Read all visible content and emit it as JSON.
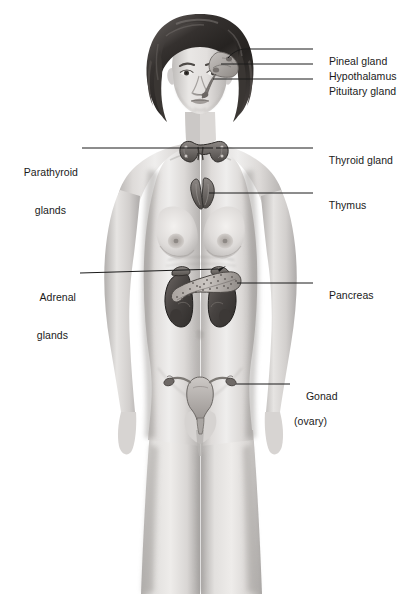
{
  "figure": {
    "style": "grayscale pencil/airbrush medical illustration",
    "background_color": "#ffffff",
    "line_color": "#1a1a1a",
    "text_color": "#1a1a1a"
  },
  "labels": {
    "pineal": {
      "line1": "Pineal gland",
      "line2": ""
    },
    "hypothalamus": {
      "line1": "Hypothalamus",
      "line2": ""
    },
    "pituitary": {
      "line1": "Pituitary gland",
      "line2": ""
    },
    "thyroid": {
      "line1": "Thyroid gland",
      "line2": ""
    },
    "thymus": {
      "line1": "Thymus",
      "line2": ""
    },
    "pancreas": {
      "line1": "Pancreas",
      "line2": ""
    },
    "gonad": {
      "line1": "Gonad",
      "line2": "(ovary)"
    },
    "parathyroid": {
      "line1": "Parathyroid",
      "line2": "glands"
    },
    "adrenal": {
      "line1": "Adrenal",
      "line2": "glands"
    }
  },
  "organs": {
    "brain_structures": "pineal gland, hypothalamus and pituitary gland shown inside head",
    "thyroid": "butterfly-shaped gland at base of neck",
    "thymus": "bilobed gland behind upper sternum",
    "adrenal_glands": "caps on superior pole of each kidney",
    "kidneys": "paired dark bean-shaped organs flanking the spine",
    "pancreas": "elongated stippled gland across the upper abdomen",
    "uterus_ovaries": "uterus with fallopian tubes and paired ovaries in pelvis"
  },
  "colors": {
    "skin_light": "#e8e6e4",
    "skin_mid": "#cfcccb",
    "skin_shadow": "#a9a6a5",
    "hair_dark": "#2e2b29",
    "hair_mid": "#4f4b48",
    "organ_dark": "#4a4644",
    "organ_mid": "#6f6a67",
    "organ_light": "#9e9996",
    "leader_line": "#1a1a1a"
  }
}
